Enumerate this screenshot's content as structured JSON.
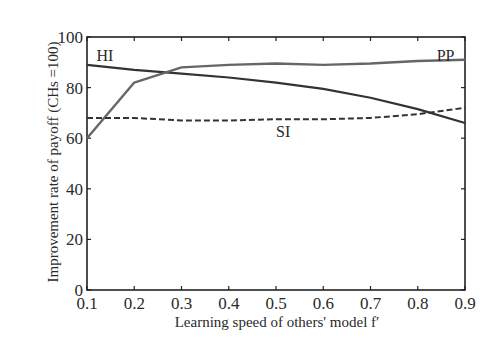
{
  "chart_data": {
    "type": "line",
    "title": "",
    "xlabel": "Learning speed of others' model f′",
    "ylabel": "Improvement rate of payoff (CHs =100)",
    "x": [
      0.1,
      0.2,
      0.3,
      0.4,
      0.5,
      0.6,
      0.7,
      0.8,
      0.9
    ],
    "xticks": [
      "0.1",
      "0.2",
      "0.3",
      "0.4",
      "0.5",
      "0.6",
      "0.7",
      "0.8",
      "0.9"
    ],
    "yticks": [
      "0",
      "20",
      "40",
      "60",
      "80",
      "100"
    ],
    "xlim": [
      0.1,
      0.9
    ],
    "ylim": [
      0,
      100
    ],
    "grid": false,
    "legend": "inline labels",
    "series": [
      {
        "name": "HI",
        "style": "solid",
        "values": [
          89,
          87,
          85.5,
          84,
          82,
          79.5,
          76,
          71.5,
          66
        ]
      },
      {
        "name": "PP",
        "style": "solid-gray",
        "values": [
          60,
          82,
          88,
          89,
          89.5,
          89,
          89.5,
          90.5,
          91
        ]
      },
      {
        "name": "SI",
        "style": "dashed",
        "values": [
          68,
          68,
          67,
          67,
          67.5,
          67.5,
          68,
          69.5,
          72
        ]
      }
    ],
    "annotations": [
      {
        "text": "HI",
        "x": 0.12,
        "y": 93
      },
      {
        "text": "PP",
        "x": 0.84,
        "y": 93
      },
      {
        "text": "SI",
        "x": 0.5,
        "y": 63
      }
    ]
  }
}
